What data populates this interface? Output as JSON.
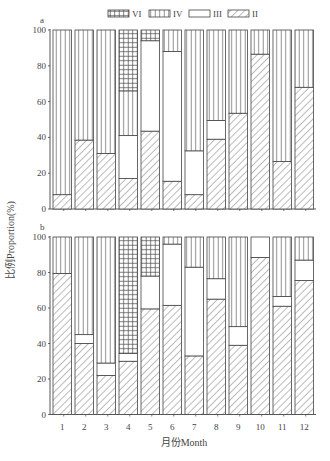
{
  "legend": [
    {
      "key": "VI",
      "label": "VI",
      "pattern": "grid"
    },
    {
      "key": "IV",
      "label": "IV",
      "pattern": "vlines"
    },
    {
      "key": "III",
      "label": "III",
      "pattern": "blank"
    },
    {
      "key": "II",
      "label": "II",
      "pattern": "diag"
    }
  ],
  "axes": {
    "ylabel": "比例Proportion(%)",
    "xlabel": "月份Month",
    "yticks": [
      "0",
      "20",
      "40",
      "60",
      "80",
      "100"
    ],
    "xticks": [
      "1",
      "2",
      "3",
      "4",
      "5",
      "6",
      "7",
      "8",
      "9",
      "10",
      "11",
      "12"
    ]
  },
  "panels": [
    {
      "label": "a"
    },
    {
      "label": "b"
    }
  ],
  "caption": "图 … 各月份不同类群比例（图注文字不清晰）",
  "chart_data": [
    {
      "type": "bar",
      "stacked": true,
      "panel": "a",
      "title": "a",
      "xlabel": "月份Month",
      "ylabel": "比例Proportion(%)",
      "ylim": [
        0,
        100
      ],
      "categories": [
        "1",
        "2",
        "3",
        "4",
        "5",
        "6",
        "7",
        "8",
        "9",
        "10",
        "11",
        "12"
      ],
      "series": [
        {
          "name": "II",
          "values": [
            8,
            38.5,
            31,
            17,
            43.5,
            15.5,
            8,
            39,
            53.5,
            86.5,
            26.5,
            68
          ]
        },
        {
          "name": "III",
          "values": [
            0,
            0,
            0,
            24,
            50.5,
            72.5,
            24.5,
            10.5,
            0,
            0,
            0,
            0
          ]
        },
        {
          "name": "IV",
          "values": [
            92,
            61.5,
            69,
            25,
            0,
            12,
            67.5,
            50.5,
            46.5,
            13.5,
            73.5,
            32
          ]
        },
        {
          "name": "VI",
          "values": [
            0,
            0,
            0,
            34,
            6,
            0,
            0,
            0,
            0,
            0,
            0,
            0
          ]
        }
      ],
      "legend_position": "top"
    },
    {
      "type": "bar",
      "stacked": true,
      "panel": "b",
      "title": "b",
      "xlabel": "月份Month",
      "ylabel": "比例Proportion(%)",
      "ylim": [
        0,
        100
      ],
      "categories": [
        "1",
        "2",
        "3",
        "4",
        "5",
        "6",
        "7",
        "8",
        "9",
        "10",
        "11",
        "12"
      ],
      "series": [
        {
          "name": "II",
          "values": [
            79.5,
            40,
            22,
            30,
            59.5,
            61.5,
            33,
            65,
            39,
            88.5,
            61,
            75.5
          ]
        },
        {
          "name": "III",
          "values": [
            0,
            5,
            7,
            4.5,
            18.5,
            34.5,
            50,
            11.5,
            10.5,
            11.5,
            5.5,
            11.5
          ]
        },
        {
          "name": "IV",
          "values": [
            20.5,
            55,
            71,
            0,
            0,
            4,
            17,
            23.5,
            50.5,
            0,
            33.5,
            13
          ]
        },
        {
          "name": "VI",
          "values": [
            0,
            0,
            0,
            65.5,
            22,
            0,
            0,
            0,
            0,
            0,
            0,
            0
          ]
        }
      ],
      "legend_position": "top"
    }
  ]
}
